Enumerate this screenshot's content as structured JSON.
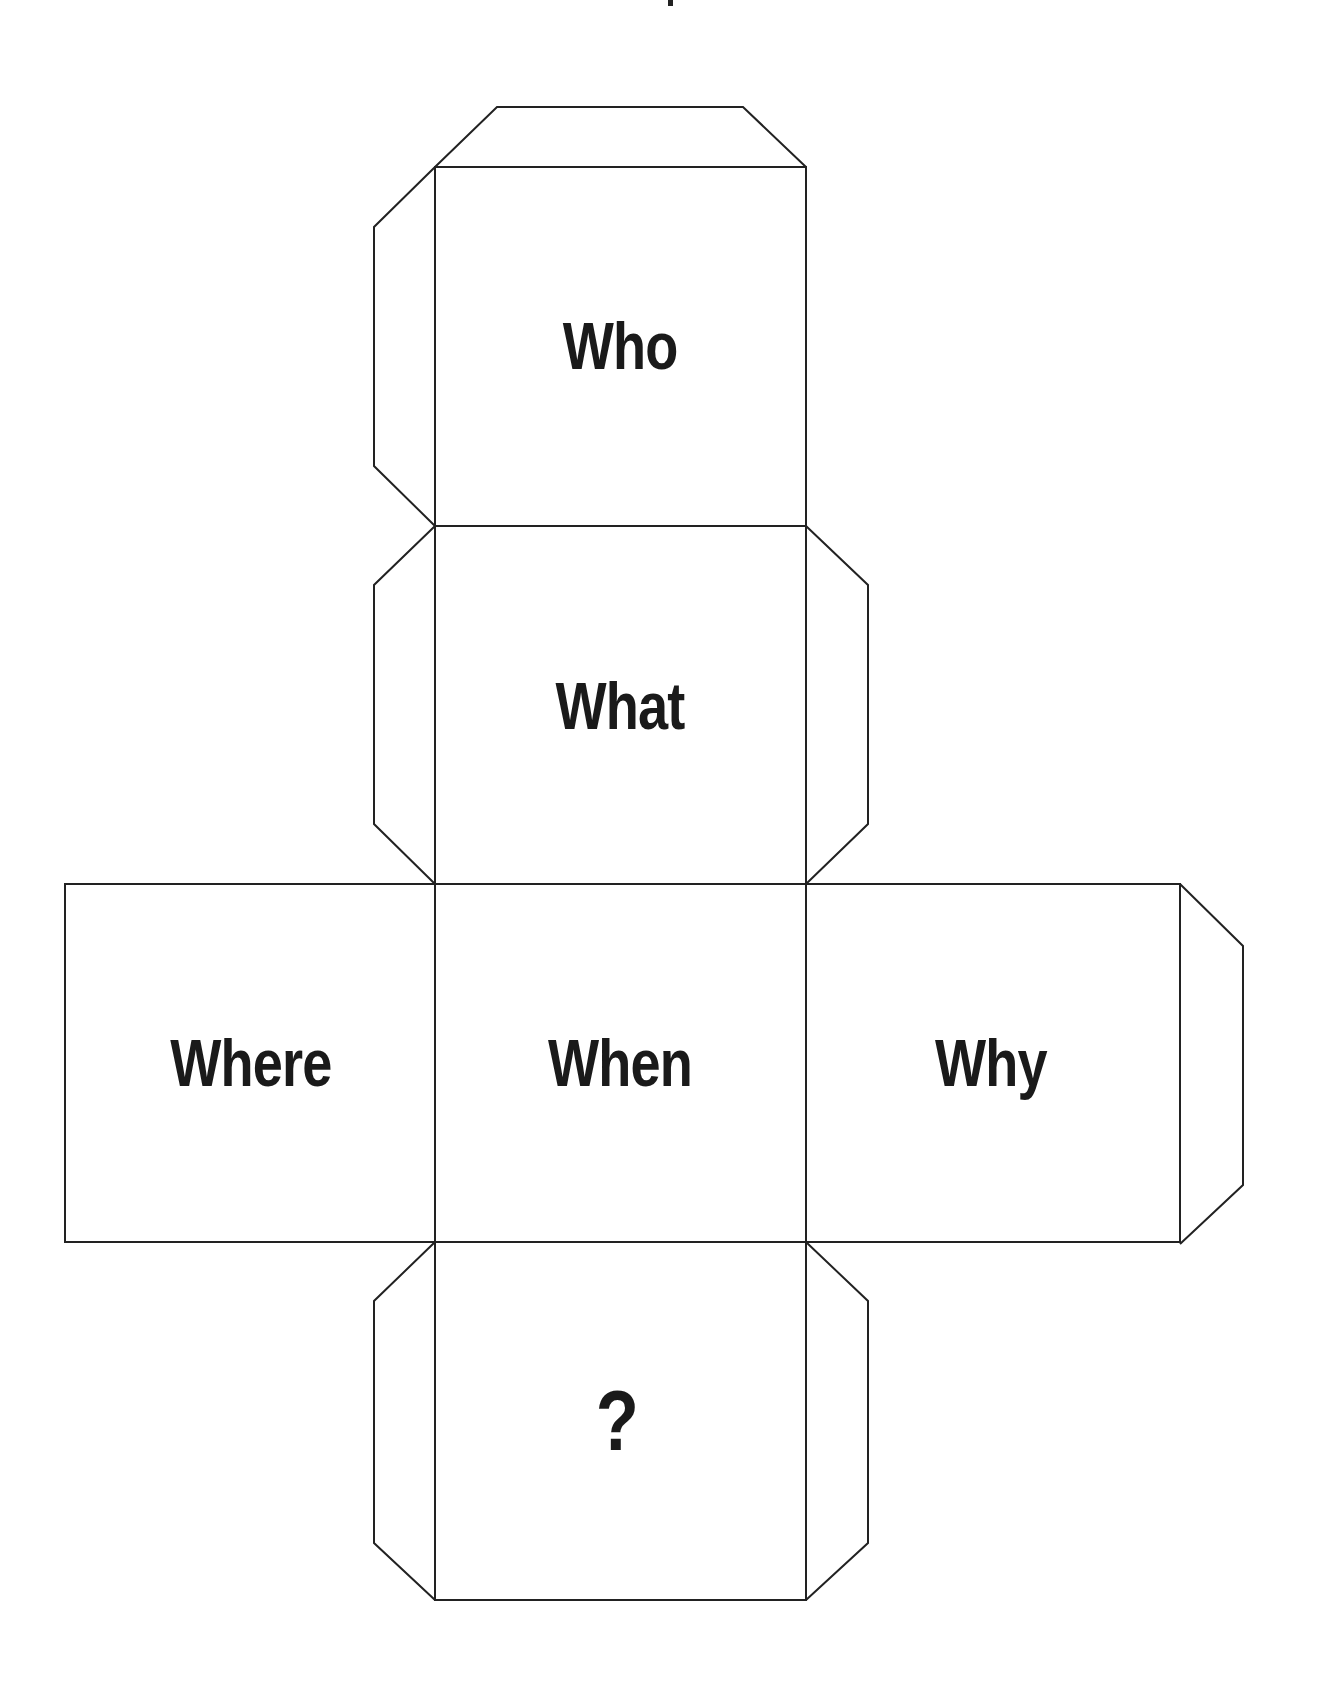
{
  "colors": {
    "line": "#222222",
    "text": "#1a1a1a",
    "background": "#ffffff"
  },
  "cube_net": {
    "faces": [
      {
        "id": "top",
        "label": "Who"
      },
      {
        "id": "front",
        "label": "What"
      },
      {
        "id": "center",
        "label": "When"
      },
      {
        "id": "left",
        "label": "Where"
      },
      {
        "id": "right",
        "label": "Why"
      },
      {
        "id": "bottom",
        "label": "?"
      }
    ]
  }
}
